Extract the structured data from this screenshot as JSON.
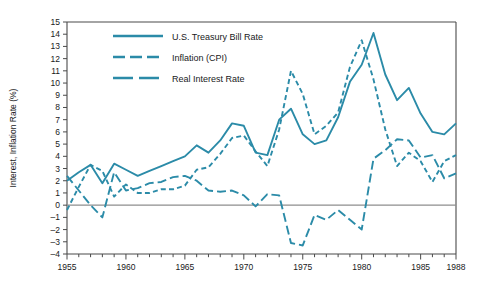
{
  "chart_data": {
    "type": "line",
    "title": "",
    "xlabel": "",
    "ylabel": "Interest, Inflation Rate (%)",
    "xlim": [
      1955,
      1988
    ],
    "ylim": [
      -4,
      15
    ],
    "grid": false,
    "legend_position": "top-left-inside",
    "x_tick_labels": [
      "1955",
      "1960",
      "1965",
      "1970",
      "1975",
      "1980",
      "1985",
      "1988"
    ],
    "x_tick_values": [
      1955,
      1960,
      1965,
      1970,
      1975,
      1980,
      1985,
      1988
    ],
    "x_minor_ticks_every": 1,
    "y_tick_labels": [
      "15",
      "14",
      "13",
      "12",
      "11",
      "10",
      "9",
      "8",
      "7",
      "6",
      "5",
      "4",
      "3",
      "2",
      "1",
      "0",
      "–1",
      "–2",
      "–3",
      "–4"
    ],
    "y_tick_values": [
      15,
      14,
      13,
      12,
      11,
      10,
      9,
      8,
      7,
      6,
      5,
      4,
      3,
      2,
      1,
      0,
      -1,
      -2,
      -3,
      -4
    ],
    "zero_line": 0,
    "line_color": "#2b8ba8",
    "zero_line_color": "#8e8e8e",
    "axis_color": "#4a4a4a",
    "x": [
      1955,
      1956,
      1957,
      1958,
      1959,
      1960,
      1961,
      1962,
      1963,
      1964,
      1965,
      1966,
      1967,
      1968,
      1969,
      1970,
      1971,
      1972,
      1973,
      1974,
      1975,
      1976,
      1977,
      1978,
      1979,
      1980,
      1981,
      1982,
      1983,
      1984,
      1985,
      1986,
      1987,
      1988
    ],
    "series": [
      {
        "name": "U.S. Treasury Bill Rate",
        "style": "solid",
        "color": "#2b8ba8",
        "values": [
          2.0,
          2.7,
          3.3,
          1.8,
          3.4,
          2.9,
          2.4,
          2.8,
          3.2,
          3.6,
          4.0,
          4.9,
          4.3,
          5.3,
          6.7,
          6.5,
          4.3,
          4.1,
          7.0,
          7.9,
          5.8,
          5.0,
          5.3,
          7.2,
          10.1,
          11.5,
          14.1,
          10.7,
          8.6,
          9.6,
          7.5,
          6.0,
          5.8,
          6.7
        ]
      },
      {
        "name": "Inflation (CPI)",
        "style": "dashed-short",
        "color": "#2b8ba8",
        "values": [
          -0.4,
          1.5,
          3.3,
          2.8,
          0.7,
          1.7,
          1.0,
          1.0,
          1.3,
          1.3,
          1.6,
          2.9,
          3.1,
          4.2,
          5.5,
          5.7,
          4.4,
          3.2,
          6.2,
          11.0,
          9.1,
          5.8,
          6.5,
          7.6,
          11.3,
          13.5,
          10.3,
          6.2,
          3.2,
          4.3,
          3.6,
          1.9,
          3.6,
          4.1
        ]
      },
      {
        "name": "Real Interest Rate",
        "style": "dashed-long",
        "color": "#2b8ba8",
        "values": [
          2.4,
          1.2,
          0.0,
          -1.0,
          2.7,
          1.2,
          1.4,
          1.8,
          1.9,
          2.3,
          2.4,
          2.0,
          1.2,
          1.1,
          1.2,
          0.8,
          -0.1,
          0.9,
          0.8,
          -3.1,
          -3.3,
          -0.8,
          -1.2,
          -0.4,
          -1.2,
          -2.0,
          3.8,
          4.5,
          5.4,
          5.3,
          3.9,
          4.1,
          2.2,
          2.6
        ]
      }
    ]
  },
  "legend": {
    "items": [
      {
        "label": "U.S. Treasury Bill Rate",
        "style": "solid"
      },
      {
        "label": "Inflation (CPI)",
        "style": "dashed-short"
      },
      {
        "label": "Real Interest Rate",
        "style": "dashed-long"
      }
    ]
  },
  "axes": {
    "y_title": "Interest, Inflation Rate (%)"
  }
}
